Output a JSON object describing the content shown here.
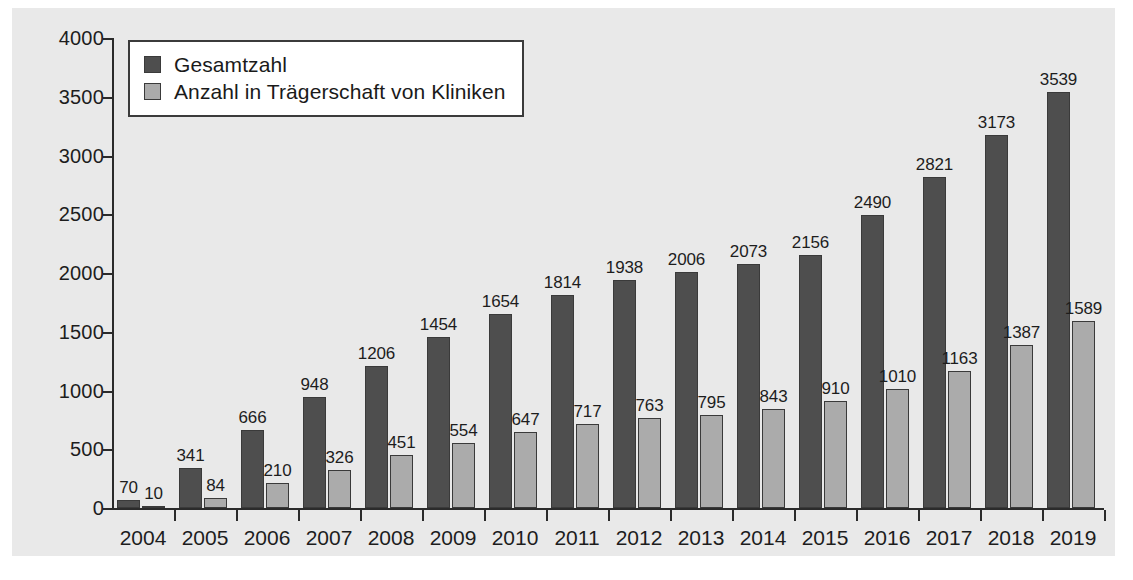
{
  "chart_data": {
    "type": "bar",
    "title": "",
    "xlabel": "",
    "ylabel": "",
    "ylim": [
      0,
      4000
    ],
    "yticks": [
      0,
      500,
      1000,
      1500,
      2000,
      2500,
      3000,
      3500,
      4000
    ],
    "ytick_labels": [
      "0",
      "500",
      "1000",
      "1500",
      "2000",
      "2500",
      "3000",
      "3500",
      "4000"
    ],
    "grid": false,
    "legend_position": "top-left",
    "categories": [
      "2004",
      "2005",
      "2006",
      "2007",
      "2008",
      "2009",
      "2010",
      "2011",
      "2012",
      "2013",
      "2014",
      "2015",
      "2016",
      "2017",
      "2018",
      "2019"
    ],
    "series": [
      {
        "name": "Gesamtzahl",
        "color": "#4e4e4e",
        "values": [
          70,
          341,
          666,
          948,
          1206,
          1454,
          1654,
          1814,
          1938,
          2006,
          2073,
          2156,
          2490,
          2821,
          3173,
          3539
        ],
        "labels": [
          "70",
          "341",
          "666",
          "948",
          "1206",
          "1454",
          "1654",
          "1814",
          "1938",
          "2006",
          "2073",
          "2156",
          "2490",
          "2821",
          "3173",
          "3539"
        ]
      },
      {
        "name": "Anzahl in Trägerschaft von Kliniken",
        "color": "#ababab",
        "values": [
          10,
          84,
          210,
          326,
          451,
          554,
          647,
          717,
          763,
          795,
          843,
          910,
          1010,
          1163,
          1387,
          1589
        ],
        "labels": [
          "10",
          "84",
          "210",
          "326",
          "451",
          "554",
          "647",
          "717",
          "763",
          "795",
          "843",
          "910",
          "1010",
          "1163",
          "1387",
          "1589"
        ]
      }
    ]
  },
  "legend": {
    "items": [
      {
        "label": "Gesamtzahl",
        "color": "#4e4e4e"
      },
      {
        "label": "Anzahl in Trägerschaft von Kliniken",
        "color": "#ababab"
      }
    ]
  },
  "colors": {
    "series_total": "#4e4e4e",
    "series_clinic": "#ababab",
    "panel_background": "#e9e9e9",
    "axis": "#2b2b2b",
    "text": "#1d1d1d"
  }
}
